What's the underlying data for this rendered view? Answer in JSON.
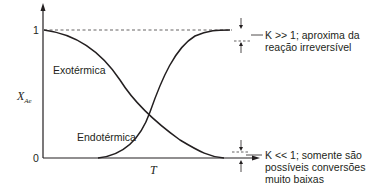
{
  "diagram": {
    "type": "conversion-vs-temperature",
    "y_axis": {
      "label": "X",
      "label_subscript": "Ae",
      "tick_top": "1",
      "tick_bottom": "0"
    },
    "x_axis": {
      "label": "T"
    },
    "curves": [
      {
        "name": "Exotérmica",
        "shape": "decreasing from 1 to 0"
      },
      {
        "name": "Endotérmica",
        "shape": "increasing from 0 to 1"
      }
    ],
    "annotations": {
      "top": {
        "line1": "K >> 1; aproxima da",
        "line2": "reação irreversível"
      },
      "bottom": {
        "line1": "K << 1; somente são",
        "line2": "possíveis conversões",
        "line3": "muito baixas"
      }
    },
    "colors": {
      "ink": "#231f20",
      "background": "#ffffff"
    }
  }
}
